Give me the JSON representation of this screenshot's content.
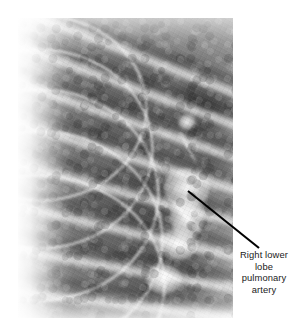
{
  "figure": {
    "type": "medical-radiograph-annotated-figure",
    "background_color": "#ffffff",
    "width": 301,
    "height": 333
  },
  "radiograph": {
    "name": "chest-xray-right-lung",
    "modality": "plain radiograph",
    "region": "right hemithorax",
    "frame": {
      "x": 18,
      "y": 18,
      "width": 215,
      "height": 300
    },
    "tone": {
      "base_gray": "#8e8e8e",
      "lung_field_dark": "#5a5a5a",
      "rib_light": "#f6f6f6",
      "border_light": "#ffffff"
    },
    "features": [
      {
        "name": "rib-bands",
        "description": "light curved rib shadows sweeping from upper left to lower right"
      },
      {
        "name": "intercostal-lucencies",
        "description": "darker lung interspaces between ribs"
      },
      {
        "name": "hilar-bright-structure",
        "description": "bright branching vascular density at center right"
      },
      {
        "name": "mediastinal-shadow",
        "description": "dark dense area along the upper right border"
      },
      {
        "name": "costophrenic-margin",
        "description": "lighter band along the lower border"
      }
    ]
  },
  "annotation": {
    "name": "right-lower-lobe-pulmonary-artery",
    "lines": [
      "Right lower",
      "lobe",
      "pulmonary",
      "artery"
    ],
    "text_color": "#1a1a1a",
    "leader_line": {
      "color": "#000000",
      "width": 2.1,
      "start": {
        "x": 188,
        "y": 191
      },
      "end": {
        "x": 259,
        "y": 248
      }
    }
  }
}
